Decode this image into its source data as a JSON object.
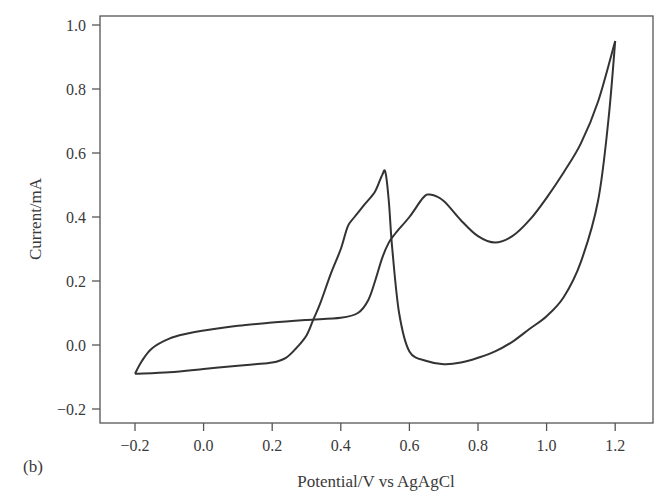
{
  "panel_label": "(b)",
  "chart_data": {
    "type": "line",
    "title": "",
    "xlabel": "Potential/V vs AgAgCl",
    "ylabel": "Current/mA",
    "xlim": [
      -0.29,
      1.32
    ],
    "ylim": [
      -0.24,
      1.03
    ],
    "xticks": [
      -0.2,
      0.0,
      0.2,
      0.4,
      0.6,
      0.8,
      1.0,
      1.2
    ],
    "xtick_labels": [
      "−0.2",
      "0.0",
      "0.2",
      "0.4",
      "0.6",
      "0.8",
      "1.0",
      "1.2"
    ],
    "yticks": [
      -0.2,
      0.0,
      0.2,
      0.4,
      0.6,
      0.8,
      1.0
    ],
    "ytick_labels": [
      "−0.2",
      "0.0",
      "0.2",
      "0.4",
      "0.6",
      "0.8",
      "1.0"
    ],
    "grid": false,
    "legend": null,
    "line_color": "#333333",
    "series": [
      {
        "name": "anodic sweep (forward)",
        "x": [
          -0.2,
          -0.18,
          -0.15,
          -0.1,
          -0.05,
          0.0,
          0.1,
          0.2,
          0.3,
          0.4,
          0.45,
          0.48,
          0.5,
          0.52,
          0.54,
          0.56,
          0.6,
          0.64,
          0.66,
          0.7,
          0.75,
          0.8,
          0.85,
          0.9,
          0.95,
          1.0,
          1.05,
          1.1,
          1.15,
          1.2
        ],
        "y": [
          -0.09,
          -0.05,
          -0.01,
          0.02,
          0.035,
          0.045,
          0.06,
          0.07,
          0.078,
          0.085,
          0.1,
          0.14,
          0.2,
          0.27,
          0.32,
          0.35,
          0.4,
          0.46,
          0.47,
          0.45,
          0.39,
          0.34,
          0.32,
          0.34,
          0.39,
          0.46,
          0.54,
          0.63,
          0.76,
          0.95
        ]
      },
      {
        "name": "cathodic sweep (reverse)",
        "x": [
          1.2,
          1.18,
          1.15,
          1.1,
          1.05,
          1.0,
          0.95,
          0.9,
          0.85,
          0.8,
          0.75,
          0.7,
          0.65,
          0.6,
          0.57,
          0.55,
          0.54,
          0.53,
          0.52,
          0.5,
          0.47,
          0.44,
          0.42,
          0.4,
          0.37,
          0.34,
          0.32,
          0.3,
          0.27,
          0.24,
          0.2,
          0.15,
          0.1,
          0.0,
          -0.1,
          -0.2
        ],
        "y": [
          0.95,
          0.7,
          0.45,
          0.26,
          0.15,
          0.09,
          0.05,
          0.01,
          -0.02,
          -0.04,
          -0.055,
          -0.06,
          -0.05,
          -0.02,
          0.1,
          0.3,
          0.45,
          0.54,
          0.53,
          0.48,
          0.44,
          0.4,
          0.37,
          0.3,
          0.22,
          0.13,
          0.08,
          0.03,
          -0.01,
          -0.04,
          -0.055,
          -0.06,
          -0.065,
          -0.075,
          -0.085,
          -0.09
        ]
      }
    ],
    "annotations": [
      {
        "text": "(b)",
        "position": "bottom-left panel label"
      }
    ]
  }
}
